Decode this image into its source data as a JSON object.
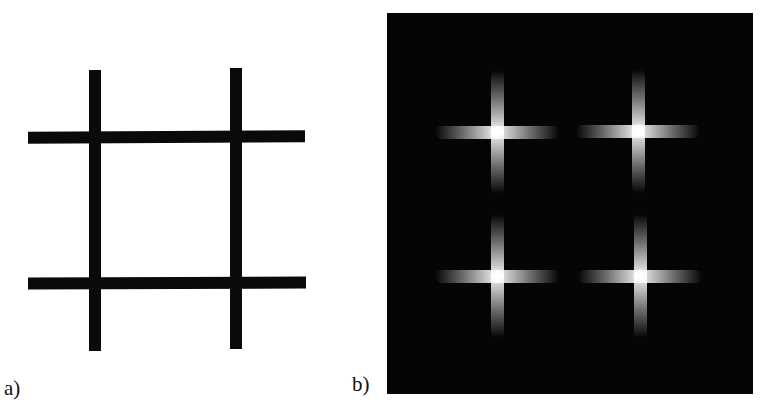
{
  "figure": {
    "panels": [
      {
        "id": "a",
        "label": "a)",
        "description": "Grid of two horizontal and two vertical black bars on white background forming a hash pattern",
        "bar_color": "#0a0a0a",
        "background_color": "#ffffff",
        "horizontal_bars": 2,
        "vertical_bars": 2,
        "intersections": 4
      },
      {
        "id": "b",
        "label": "b)",
        "description": "Dark image with four bright cross-shaped glowing regions centered at the intersection points",
        "background_color": "#050505",
        "glow_color": "#ffffff",
        "crosses": 4
      }
    ]
  }
}
